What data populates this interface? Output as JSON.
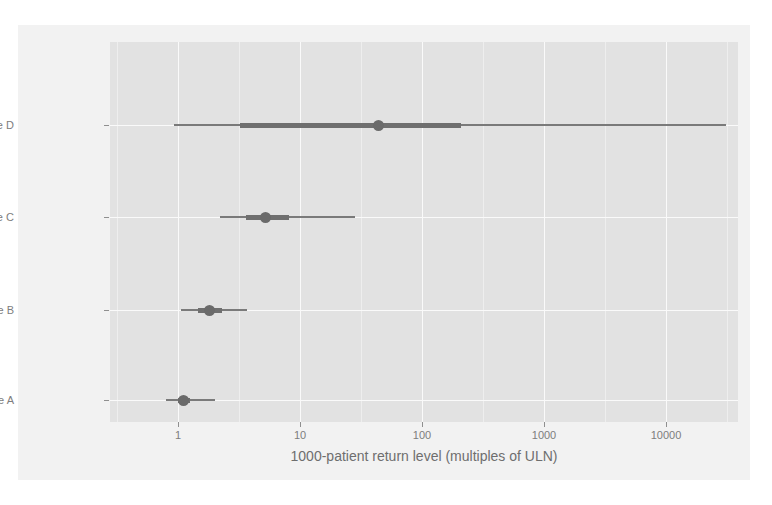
{
  "chart_data": {
    "type": "bar",
    "subtype": "interval-plot",
    "title": "",
    "xlabel": "1000-patient return level (multiples of ULN)",
    "ylabel": "",
    "xscale": "log10",
    "xlim": [
      0.55,
      55000
    ],
    "grid": true,
    "legend": null,
    "x_ticks": [
      {
        "value": 1,
        "label": "1"
      },
      {
        "value": 10,
        "label": "10"
      },
      {
        "value": 100,
        "label": "100"
      },
      {
        "value": 1000,
        "label": "1000"
      },
      {
        "value": 10000,
        "label": "10000"
      }
    ],
    "categories": [
      "Dose A",
      "Dose B",
      "Dose C",
      "Dose D"
    ],
    "series": [
      {
        "name": "Dose D",
        "point_estimate": 44,
        "inner_lo": 3.2,
        "inner_hi": 210,
        "outer_lo": 0.92,
        "outer_hi": 31000
      },
      {
        "name": "Dose C",
        "point_estimate": 5.2,
        "inner_lo": 3.6,
        "inner_hi": 8.1,
        "outer_lo": 2.2,
        "outer_hi": 28
      },
      {
        "name": "Dose B",
        "point_estimate": 1.8,
        "inner_lo": 1.45,
        "inner_hi": 2.3,
        "outer_lo": 1.06,
        "outer_hi": 3.7
      },
      {
        "name": "Dose A",
        "point_estimate": 1.1,
        "inner_lo": 1.0,
        "inner_hi": 1.25,
        "outer_lo": 0.79,
        "outer_hi": 2.0
      }
    ],
    "colors": {
      "panel_background": "#e2e2e2",
      "figure_background": "#f2f2f2",
      "gridline": "#fafafa",
      "interval": "#6f6f6f",
      "point": "#6a6a6a",
      "axis_text": "#7d7d7d"
    }
  }
}
